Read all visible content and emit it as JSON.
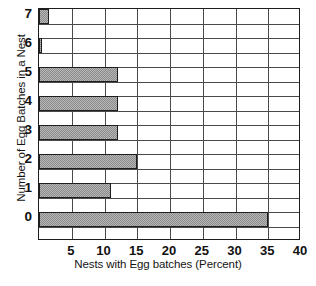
{
  "chart_data": {
    "type": "bar",
    "orientation": "horizontal",
    "title": "",
    "xlabel": "Nests with Egg batches (Percent)",
    "ylabel": "Number of Egg Batches in a Nest",
    "categories": [
      "0",
      "1",
      "2",
      "3",
      "4",
      "5",
      "6",
      "7"
    ],
    "values": [
      35,
      11,
      15,
      12,
      12,
      12,
      0.5,
      1.5
    ],
    "xlim": [
      0,
      40
    ],
    "xticks": [
      5,
      10,
      15,
      20,
      25,
      30,
      35,
      40
    ],
    "xtick_labels": [
      "5",
      "10",
      "15",
      "20",
      "25",
      "30",
      "35",
      "40"
    ],
    "ytick_labels": [
      "7",
      "6",
      "5",
      "4",
      "3",
      "2",
      "1",
      "0"
    ],
    "grid": "vertical-and-horizontal",
    "legend": "none",
    "bar_fill": "#b8b8b8",
    "bar_pattern": "checkerboard-dither",
    "bar_edge_color": "#1e1e1e",
    "grid_color": "#4a4a4a",
    "frame_color": "#1e1e1e",
    "background": "#ffffff"
  }
}
